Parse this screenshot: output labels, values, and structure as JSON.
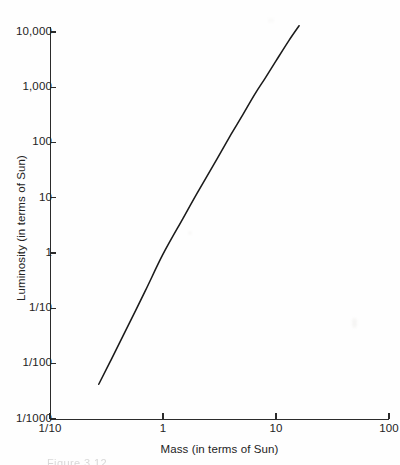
{
  "figure": {
    "caption_remnant": "Figure 3.12"
  },
  "chart_data": {
    "type": "line",
    "title": "",
    "xlabel": "Mass  (in terms of Sun)",
    "ylabel": "Luminosity (in terms of Sun)",
    "xscale": "log",
    "yscale": "log",
    "xlim": [
      0.1,
      100
    ],
    "ylim": [
      0.001,
      10000
    ],
    "grid": false,
    "legend": null,
    "line_color": "#1b1b1b",
    "background_color": "#fefefe",
    "xticks": [
      {
        "value": 0.1,
        "label": "1/10"
      },
      {
        "value": 1,
        "label": "1"
      },
      {
        "value": 10,
        "label": "10"
      },
      {
        "value": 100,
        "label": "100"
      }
    ],
    "yticks": [
      {
        "value": 10000,
        "label": "10,000"
      },
      {
        "value": 1000,
        "label": "1,000"
      },
      {
        "value": 100,
        "label": "100"
      },
      {
        "value": 10,
        "label": "10"
      },
      {
        "value": 1,
        "label": "1"
      },
      {
        "value": 0.1,
        "label": "1/10"
      },
      {
        "value": 0.01,
        "label": "1/100"
      },
      {
        "value": 0.001,
        "label": "1/1000"
      }
    ],
    "series": [
      {
        "name": "Mass-luminosity relation",
        "x": [
          0.27,
          0.35,
          0.5,
          0.7,
          1.0,
          1.5,
          2.0,
          3.0,
          4.0,
          5.0,
          6.5,
          8.0,
          10.0,
          13.0,
          16.0
        ],
        "y": [
          0.0042,
          0.012,
          0.052,
          0.21,
          0.95,
          4.2,
          12.0,
          50.0,
          140.0,
          300.0,
          750.0,
          1450.0,
          3000.0,
          7000.0,
          13000.0
        ]
      }
    ]
  }
}
